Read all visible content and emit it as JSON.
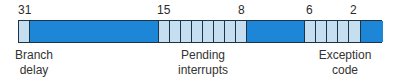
{
  "bit_numbers": [
    {
      "text": "31",
      "x": 18
    },
    {
      "text": "15",
      "x": 157
    },
    {
      "text": "8",
      "x": 238
    },
    {
      "text": "6",
      "x": 306
    },
    {
      "text": "2",
      "x": 350
    }
  ],
  "colors": {
    "field": "#c6dff0",
    "reserved": "#1e86d6",
    "border": "#1d3347"
  },
  "cells": [
    {
      "type": "light",
      "width": 11,
      "field": "branch-delay"
    },
    {
      "type": "dark",
      "width": 129,
      "field": "reserved"
    },
    {
      "type": "light",
      "width": 11,
      "field": "pending-interrupt"
    },
    {
      "type": "light",
      "width": 11,
      "field": "pending-interrupt"
    },
    {
      "type": "light",
      "width": 11,
      "field": "pending-interrupt"
    },
    {
      "type": "light",
      "width": 11,
      "field": "pending-interrupt"
    },
    {
      "type": "light",
      "width": 11,
      "field": "pending-interrupt"
    },
    {
      "type": "light",
      "width": 11,
      "field": "pending-interrupt"
    },
    {
      "type": "light",
      "width": 11,
      "field": "pending-interrupt"
    },
    {
      "type": "light",
      "width": 11,
      "field": "pending-interrupt"
    },
    {
      "type": "dark",
      "width": 58,
      "field": "reserved"
    },
    {
      "type": "light",
      "width": 11,
      "field": "exception-code"
    },
    {
      "type": "light",
      "width": 11,
      "field": "exception-code"
    },
    {
      "type": "light",
      "width": 11,
      "field": "exception-code"
    },
    {
      "type": "light",
      "width": 11,
      "field": "exception-code"
    },
    {
      "type": "light",
      "width": 12,
      "field": "exception-code"
    },
    {
      "type": "dark",
      "width": 22,
      "field": "reserved"
    }
  ],
  "labels": {
    "branch_delay": {
      "line1": "Branch",
      "line2": "delay"
    },
    "pending_interrupts": {
      "line1": "Pending",
      "line2": "interrupts"
    },
    "exception_code": {
      "line1": "Exception",
      "line2": "code"
    }
  }
}
